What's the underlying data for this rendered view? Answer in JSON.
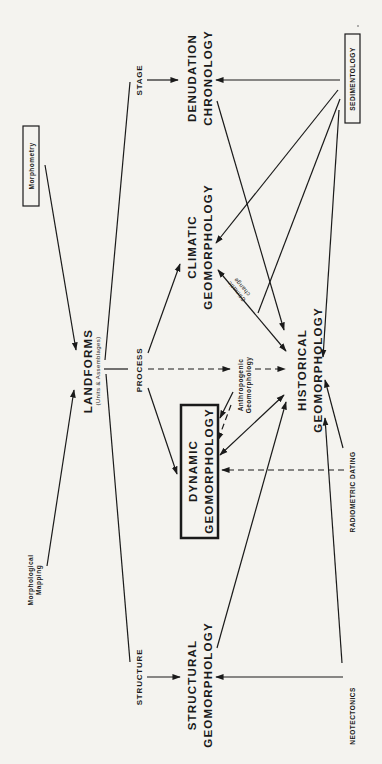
{
  "diagram": {
    "orientation": "rotated 90 degrees counter-clockwise",
    "nodes": {
      "landforms": {
        "label": "LANDFORMS",
        "sublabel": "(Units & Assemblages)"
      },
      "morphometry": {
        "label": "Morphometry",
        "boxed": true
      },
      "morphological_mapping": {
        "label_line1": "Morphological",
        "label_line2": "Mapping"
      },
      "stage": {
        "label": "STAGE"
      },
      "process": {
        "label": "PROCESS"
      },
      "structure": {
        "label": "STRUCTURE"
      },
      "denudation_chronology": {
        "label_line1": "DENUDATION",
        "label_line2": "CHRONOLOGY"
      },
      "climatic_geomorphology": {
        "label_line1": "CLIMATIC",
        "label_line2": "GEOMORPHOLOGY"
      },
      "dynamic_geomorphology": {
        "label_line1": "DYNAMIC",
        "label_line2": "GEOMORPHOLOGY",
        "boxed": true
      },
      "structural_geomorphology": {
        "label_line1": "STRUCTURAL",
        "label_line2": "GEOMORPHOLOGY"
      },
      "anthropogenic_geomorphology": {
        "label_line1": "Anthropogenic",
        "label_line2": "Geomorphology"
      },
      "historical_geomorphology": {
        "label_line1": "HISTORICAL",
        "label_line2": "GEOMORPHOLOGY"
      },
      "sedimentology": {
        "label": "SEDIMENTOLOGY",
        "boxed": true
      },
      "radiometric_dating": {
        "label": "RADIOMETRIC DATING"
      },
      "neotectonics": {
        "label": "NEOTECTONICS"
      }
    },
    "edge_labels": {
      "climatic_change_line1": "Climatic",
      "climatic_change_line2": "change"
    },
    "edges": [
      {
        "from": "Morphometry",
        "to": "LANDFORMS",
        "style": "solid"
      },
      {
        "from": "Morphological Mapping",
        "to": "LANDFORMS",
        "style": "solid"
      },
      {
        "from": "LANDFORMS",
        "to": "STAGE",
        "style": "solid"
      },
      {
        "from": "LANDFORMS",
        "to": "PROCESS",
        "style": "solid"
      },
      {
        "from": "LANDFORMS",
        "to": "STRUCTURE",
        "style": "solid"
      },
      {
        "from": "STAGE",
        "to": "DENUDATION CHRONOLOGY",
        "style": "arrow"
      },
      {
        "from": "PROCESS",
        "to": "CLIMATIC GEOMORPHOLOGY",
        "style": "arrow"
      },
      {
        "from": "PROCESS",
        "to": "DYNAMIC GEOMORPHOLOGY",
        "style": "arrow"
      },
      {
        "from": "PROCESS",
        "to": "HISTORICAL GEOMORPHOLOGY",
        "style": "dashed arrow"
      },
      {
        "from": "STRUCTURE",
        "to": "STRUCTURAL GEOMORPHOLOGY",
        "style": "arrow"
      },
      {
        "from": "SEDIMENTOLOGY",
        "to": "DENUDATION CHRONOLOGY",
        "style": "arrow"
      },
      {
        "from": "SEDIMENTOLOGY",
        "to": "CLIMATIC GEOMORPHOLOGY",
        "style": "arrow"
      },
      {
        "from": "SEDIMENTOLOGY",
        "to": "DYNAMIC GEOMORPHOLOGY",
        "style": "arrow"
      },
      {
        "from": "SEDIMENTOLOGY",
        "to": "HISTORICAL GEOMORPHOLOGY",
        "style": "arrow"
      },
      {
        "from": "DENUDATION CHRONOLOGY",
        "to": "HISTORICAL GEOMORPHOLOGY",
        "style": "arrow"
      },
      {
        "from": "CLIMATIC GEOMORPHOLOGY",
        "to": "HISTORICAL GEOMORPHOLOGY",
        "style": "double arrow",
        "label": "Climatic change"
      },
      {
        "from": "Anthropogenic Geomorphology",
        "to": "DYNAMIC GEOMORPHOLOGY",
        "style": "dashed arrow"
      },
      {
        "from": "HISTORICAL GEOMORPHOLOGY",
        "to": "DYNAMIC GEOMORPHOLOGY",
        "style": "double arrow"
      },
      {
        "from": "RADIOMETRIC DATING",
        "to": "DYNAMIC GEOMORPHOLOGY",
        "style": "dashed arrow"
      },
      {
        "from": "RADIOMETRIC DATING",
        "to": "HISTORICAL GEOMORPHOLOGY",
        "style": "arrow"
      },
      {
        "from": "STRUCTURAL GEOMORPHOLOGY",
        "to": "HISTORICAL GEOMORPHOLOGY",
        "style": "arrow"
      },
      {
        "from": "NEOTECTONICS",
        "to": "STRUCTURAL GEOMORPHOLOGY",
        "style": "arrow"
      },
      {
        "from": "NEOTECTONICS",
        "to": "HISTORICAL GEOMORPHOLOGY",
        "style": "arrow"
      }
    ]
  }
}
